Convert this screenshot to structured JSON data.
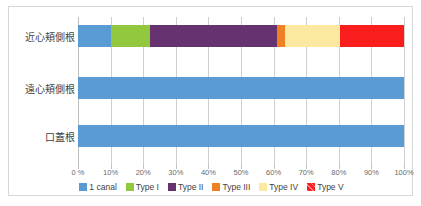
{
  "chart_data": {
    "type": "bar",
    "orientation": "horizontal",
    "stacked": "100%",
    "title": "",
    "xlabel": "",
    "ylabel": "",
    "xlim": [
      0,
      100
    ],
    "grid": true,
    "legend_position": "bottom",
    "categories": [
      "近心頬側根",
      "遠心頬側根",
      "口蓋根"
    ],
    "x_tick_labels": [
      "0 %",
      "10%",
      "20%",
      "30%",
      "40%",
      "50%",
      "60%",
      "70%",
      "80%",
      "90%",
      "100%"
    ],
    "x_tick_values": [
      0,
      10,
      20,
      30,
      40,
      50,
      60,
      70,
      80,
      90,
      100
    ],
    "series": [
      {
        "name": "1 canal",
        "color": "#5b9bd5",
        "hatch": false,
        "values": [
          10.0,
          100.0,
          100.0
        ]
      },
      {
        "name": "Type I",
        "color": "#92c83e",
        "hatch": false,
        "values": [
          12.0,
          0,
          0
        ]
      },
      {
        "name": "Type II",
        "color": "#673270",
        "hatch": false,
        "values": [
          39.0,
          0,
          0
        ]
      },
      {
        "name": "Type III",
        "color": "#ef8023",
        "hatch": false,
        "values": [
          2.5,
          0,
          0
        ]
      },
      {
        "name": "Type IV",
        "color": "#fbe9a0",
        "hatch": false,
        "values": [
          17.0,
          0,
          0
        ]
      },
      {
        "name": "Type V",
        "color": "#f91d1d",
        "hatch": true,
        "values": [
          19.5,
          0,
          0
        ]
      }
    ]
  },
  "colors": {
    "frame_border": "#d8d8d8",
    "gridline": "#cfcfcf",
    "axis_text": "#6b6b6b",
    "label_text": "#3f3f3f",
    "background": "#ffffff"
  }
}
